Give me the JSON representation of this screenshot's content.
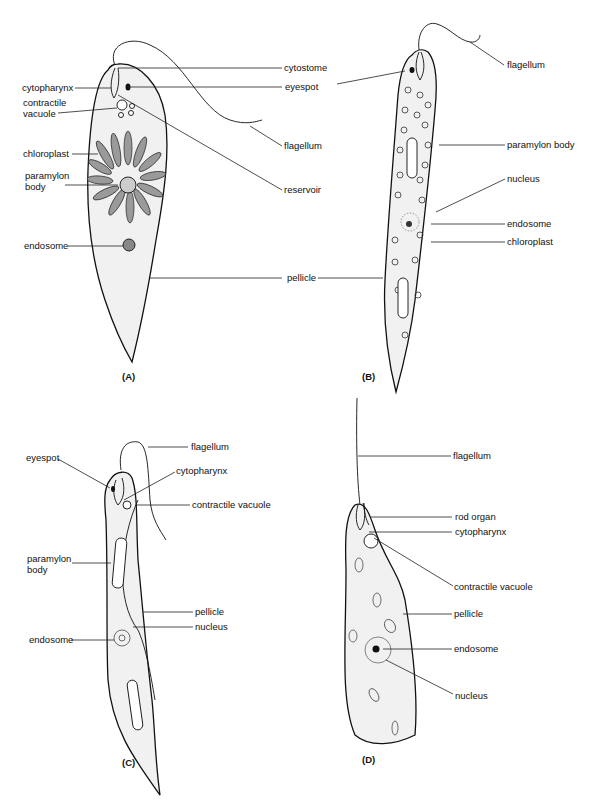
{
  "figure": {
    "panels": [
      {
        "id": "A",
        "caption": "(A)",
        "labels": {
          "cytostome": "cytostome",
          "eyespot": "eyespot",
          "cytopharynx": "cytopharynx",
          "contractile_vacuole_1": "contractile",
          "contractile_vacuole_2": "vacuole",
          "flagellum": "flagellum",
          "chloroplast": "chloroplast",
          "paramylon_1": "paramylon",
          "paramylon_2": "body",
          "reservoir": "reservoir",
          "endosome": "endosome",
          "pellicle": "pellicle"
        }
      },
      {
        "id": "B",
        "caption": "(B)",
        "labels": {
          "flagellum": "flagellum",
          "paramylon_body": "paramylon body",
          "nucleus": "nucleus",
          "endosome": "endosome",
          "chloroplast": "chloroplast"
        }
      },
      {
        "id": "C",
        "caption": "(C)",
        "labels": {
          "flagellum": "flagellum",
          "eyespot": "eyespot",
          "cytopharynx": "cytopharynx",
          "contractile_vacuole": "contractile vacuole",
          "paramylon_1": "paramylon",
          "paramylon_2": "body",
          "pellicle": "pellicle",
          "nucleus": "nucleus",
          "endosome": "endosome"
        }
      },
      {
        "id": "D",
        "caption": "(D)",
        "labels": {
          "flagellum": "flagellum",
          "rod_organ": "rod organ",
          "cytopharynx": "cytopharynx",
          "contractile_vacuole": "contractile vacuole",
          "pellicle": "pellicle",
          "endosome": "endosome",
          "nucleus": "nucleus"
        }
      }
    ]
  }
}
